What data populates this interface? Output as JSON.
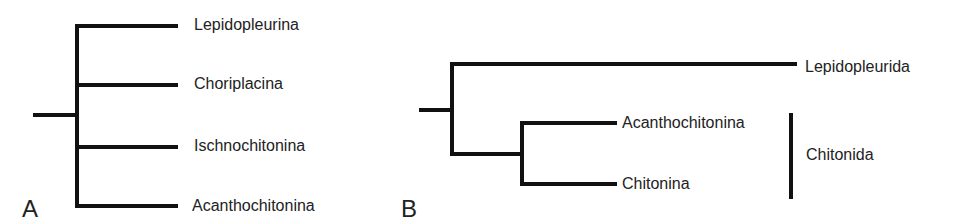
{
  "panels": {
    "a": {
      "letter": "A",
      "taxa": [
        "Lepidopleurina",
        "Choriplacina",
        "Ischnochitonina",
        "Acanthochitonina"
      ]
    },
    "b": {
      "letter": "B",
      "taxa": [
        "Lepidopleurida",
        "Acanthochitonina",
        "Chitonina"
      ],
      "clade_bracket_label": "Chitonida"
    }
  },
  "colors": {
    "line": "#111111",
    "text": "#222222",
    "background": "#ffffff"
  }
}
